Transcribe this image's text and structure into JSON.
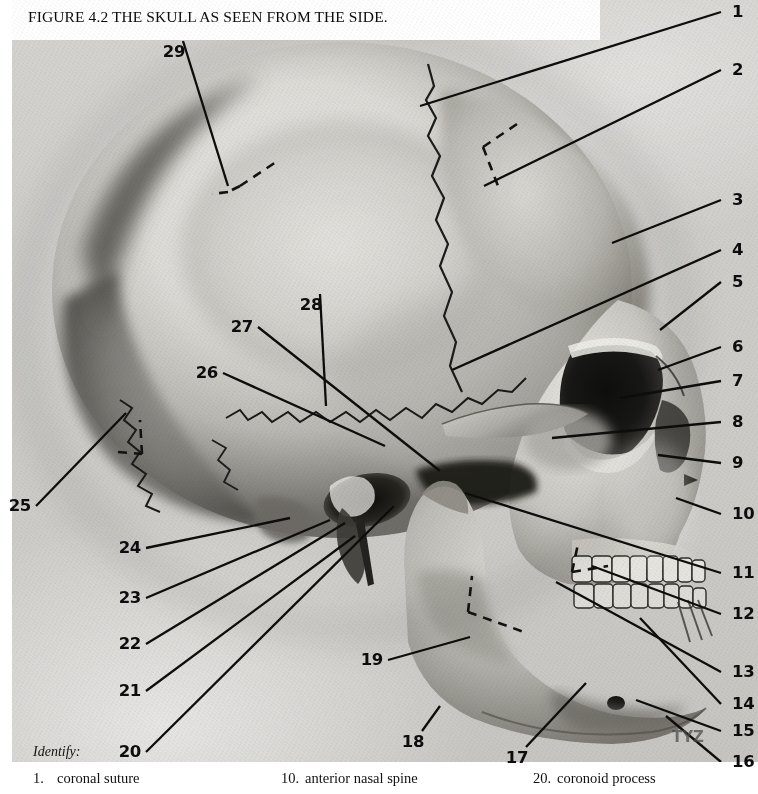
{
  "figure": {
    "title": "FIGURE 4.2  THE SKULL AS SEEN FROM THE SIDE.",
    "identify_label": "Identify:",
    "watermark": "TYZ"
  },
  "callouts": [
    {
      "id": "1",
      "side": "right",
      "x": 732,
      "y": 12,
      "tip_x": 420,
      "tip_y": 106
    },
    {
      "id": "2",
      "side": "right",
      "x": 732,
      "y": 70,
      "tip_x": 484,
      "tip_y": 186
    },
    {
      "id": "3",
      "side": "right",
      "x": 732,
      "y": 200,
      "tip_x": 612,
      "tip_y": 243
    },
    {
      "id": "4",
      "side": "right",
      "x": 732,
      "y": 250,
      "tip_x": 452,
      "tip_y": 370
    },
    {
      "id": "5",
      "side": "right",
      "x": 732,
      "y": 282,
      "tip_x": 660,
      "tip_y": 330
    },
    {
      "id": "6",
      "side": "right",
      "x": 732,
      "y": 347,
      "tip_x": 658,
      "tip_y": 370
    },
    {
      "id": "7",
      "side": "right",
      "x": 732,
      "y": 381,
      "tip_x": 620,
      "tip_y": 398
    },
    {
      "id": "8",
      "side": "right",
      "x": 732,
      "y": 422,
      "tip_x": 552,
      "tip_y": 438
    },
    {
      "id": "9",
      "side": "right",
      "x": 732,
      "y": 463,
      "tip_x": 658,
      "tip_y": 455
    },
    {
      "id": "10",
      "side": "right",
      "x": 732,
      "y": 514,
      "tip_x": 676,
      "tip_y": 498
    },
    {
      "id": "11",
      "side": "right",
      "x": 732,
      "y": 573,
      "tip_x": 465,
      "tip_y": 493
    },
    {
      "id": "12",
      "side": "right",
      "x": 732,
      "y": 614,
      "tip_x": 592,
      "tip_y": 566
    },
    {
      "id": "13",
      "side": "right",
      "x": 732,
      "y": 672,
      "tip_x": 556,
      "tip_y": 582
    },
    {
      "id": "14",
      "side": "right",
      "x": 732,
      "y": 704,
      "tip_x": 640,
      "tip_y": 618
    },
    {
      "id": "15",
      "side": "right",
      "x": 732,
      "y": 731,
      "tip_x": 636,
      "tip_y": 700
    },
    {
      "id": "16",
      "side": "right",
      "x": 732,
      "y": 762,
      "tip_x": 666,
      "tip_y": 716
    },
    {
      "id": "17",
      "side": "center",
      "x": 517,
      "y": 758,
      "tip_x": 586,
      "tip_y": 683
    },
    {
      "id": "18",
      "side": "center",
      "x": 413,
      "y": 742,
      "tip_x": 440,
      "tip_y": 706
    },
    {
      "id": "19",
      "side": "left",
      "x": 383,
      "y": 660,
      "tip_x": 470,
      "tip_y": 637
    },
    {
      "id": "20",
      "side": "left",
      "x": 141,
      "y": 752,
      "tip_x": 394,
      "tip_y": 506
    },
    {
      "id": "21",
      "side": "left",
      "x": 141,
      "y": 691,
      "tip_x": 355,
      "tip_y": 536
    },
    {
      "id": "22",
      "side": "left",
      "x": 141,
      "y": 644,
      "tip_x": 345,
      "tip_y": 523
    },
    {
      "id": "23",
      "side": "left",
      "x": 141,
      "y": 598,
      "tip_x": 330,
      "tip_y": 520
    },
    {
      "id": "24",
      "side": "left",
      "x": 141,
      "y": 548,
      "tip_x": 290,
      "tip_y": 518
    },
    {
      "id": "25",
      "side": "left",
      "x": 31,
      "y": 506,
      "tip_x": 126,
      "tip_y": 413
    },
    {
      "id": "26",
      "side": "left",
      "x": 218,
      "y": 373,
      "tip_x": 385,
      "tip_y": 446
    },
    {
      "id": "27",
      "side": "left",
      "x": 253,
      "y": 327,
      "tip_x": 440,
      "tip_y": 471
    },
    {
      "id": "28",
      "side": "center",
      "x": 311,
      "y": 305,
      "tip_x": 326,
      "tip_y": 406
    },
    {
      "id": "29",
      "side": "center",
      "x": 174,
      "y": 52,
      "tip_x": 228,
      "tip_y": 186
    }
  ],
  "caption": {
    "columns": [
      {
        "number": "1.",
        "term": "coronal suture"
      },
      {
        "number": "10.",
        "term": "anterior nasal spine"
      },
      {
        "number": "20.",
        "term": "coronoid process"
      }
    ]
  }
}
